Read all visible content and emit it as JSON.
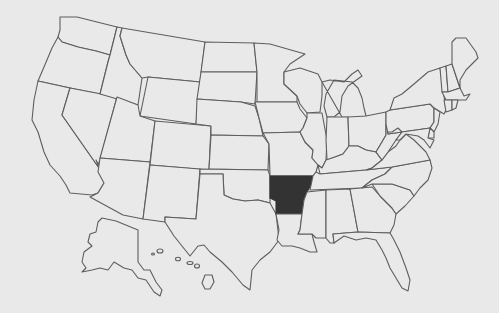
{
  "map": {
    "title": "United States map with one state highlighted",
    "region": "United States",
    "highlighted_state": "Arkansas",
    "colors": {
      "background": "#e9e9e9",
      "state_fill": "#e9e9e9",
      "state_stroke": "#5e5e5e",
      "highlight_fill": "#333333"
    },
    "states": [
      {
        "id": "WA",
        "name": "Washington",
        "points": "60,17 77,17 117,27 110,55 96,51 78,47 62,42 58,37 60,30"
      },
      {
        "id": "OR",
        "name": "Oregon",
        "points": "58,37 62,42 78,47 96,51 110,55 108,62 100,94 70,88 38,81 44,67 52,48"
      },
      {
        "id": "CA",
        "name": "California",
        "points": "38,81 70,88 62,115 106,178 104,183 98,193 92,195 70,193 66,185 60,176 50,165 44,152 38,132 32,120 34,100"
      },
      {
        "id": "NV",
        "name": "Nevada",
        "points": "70,88 117,97 100,160 98,165 96,160 106,178 62,115"
      },
      {
        "id": "ID",
        "name": "Idaho",
        "points": "117,27 122,28 120,36 126,55 130,64 142,78 138,105 100,94 108,62 110,55"
      },
      {
        "id": "MT",
        "name": "Montana",
        "points": "122,28 205,42 200,82 148,77 142,78 130,64 126,55 120,36"
      },
      {
        "id": "WY",
        "name": "Wyoming",
        "points": "148,77 200,82 196,124 140,116"
      },
      {
        "id": "UT",
        "name": "Utah",
        "points": "117,97 138,105 140,116 155,121 150,162 100,158"
      },
      {
        "id": "CO",
        "name": "Colorado",
        "points": "155,121 211,126 209,170 150,165"
      },
      {
        "id": "AZ",
        "name": "Arizona",
        "points": "100,158 150,162 143,219 123,215 90,197 98,193 104,183 98,172"
      },
      {
        "id": "NM",
        "name": "New Mexico",
        "points": "150,165 200,169 196,219 165,217 165,222 143,219"
      },
      {
        "id": "ND",
        "name": "North Dakota",
        "points": "205,42 254,43 257,72 201,72"
      },
      {
        "id": "SD",
        "name": "South Dakota",
        "points": "201,72 257,72 255,104 248,103 241,102 197,99"
      },
      {
        "id": "NE",
        "name": "Nebraska",
        "points": "197,99 241,102 255,106 259,118 263,136 211,135 211,126 196,124"
      },
      {
        "id": "KS",
        "name": "Kansas",
        "points": "211,135 263,136 269,144 268,170 209,169"
      },
      {
        "id": "OK",
        "name": "Oklahoma",
        "points": "200,169 268,170 270,176 270,203 258,200 245,201 233,199 224,195 223,174 200,174"
      },
      {
        "id": "TX",
        "name": "Texas",
        "points": "200,174 223,174 224,195 233,199 245,201 258,200 270,203 276,214 277,222 279,240 270,252 260,260 252,270 250,290 243,285 232,272 222,262 210,252 204,245 198,246 190,256 182,246 174,236 165,222 165,217 196,219"
      },
      {
        "id": "MN",
        "name": "Minnesota",
        "points": "254,43 270,44 284,48 305,54 290,64 284,72 284,84 297,96 297,102 257,102 257,72"
      },
      {
        "id": "IA",
        "name": "Iowa",
        "points": "255,102 297,102 300,109 307,118 303,128 300,132 263,133 259,118"
      },
      {
        "id": "MO",
        "name": "Missouri",
        "points": "263,133 300,132 305,142 313,150 312,158 318,165 316,172 313,176 270,176 269,144"
      },
      {
        "id": "AR",
        "name": "Arkansas",
        "highlight": true,
        "points": "270,176 313,176 311,185 307,192 304,200 302,214 276,214 276,201 270,198"
      },
      {
        "id": "LA",
        "name": "Louisiana",
        "points": "276,214 302,214 300,230 298,234 312,234 314,242 317,252 310,252 300,248 292,246 282,246 277,240 279,230"
      },
      {
        "id": "WI",
        "name": "Wisconsin",
        "points": "284,72 300,68 318,74 322,82 322,96 320,112 307,113 300,104 297,96 284,84"
      },
      {
        "id": "IL",
        "name": "Illinois",
        "points": "307,113 322,113 327,140 326,160 322,168 318,165 312,158 313,150 305,142 300,132 303,128 307,118"
      },
      {
        "id": "MI",
        "name": "Michigan",
        "points": "322,82 330,80 344,82 352,74 358,70 362,76 348,86 342,96 340,112 334,117 327,117 324,106 326,94 334,80 352,82 358,88 362,98 364,108 366,116 360,118 342,117"
      },
      {
        "id": "IN",
        "name": "Indiana",
        "points": "327,117 348,117 349,146 343,154 335,157 327,160 326,140"
      },
      {
        "id": "OH",
        "name": "Ohio",
        "points": "348,117 366,116 386,112 386,135 382,142 376,152 366,150 358,146 349,146"
      },
      {
        "id": "KY",
        "name": "Kentucky",
        "points": "318,165 322,168 326,160 335,157 343,154 349,146 358,146 366,150 376,152 382,160 372,168 366,170 320,174"
      },
      {
        "id": "TN",
        "name": "Tennessee",
        "points": "313,176 316,172 320,174 366,170 392,167 385,174 372,180 362,188 310,190"
      },
      {
        "id": "MS",
        "name": "Mississippi",
        "points": "307,192 326,190 326,238 316,238 312,234 298,234 300,230 302,214 304,200"
      },
      {
        "id": "AL",
        "name": "Alabama",
        "points": "326,190 350,189 358,232 333,234 334,243 330,243 326,238"
      },
      {
        "id": "GA",
        "name": "Georgia",
        "points": "350,189 372,187 380,196 392,208 396,214 394,225 390,233 358,232"
      },
      {
        "id": "FL",
        "name": "Florida",
        "points": "333,234 358,232 390,233 393,238 400,252 406,268 410,280 408,291 402,288 396,278 390,268 386,258 382,250 376,240 366,238 356,240 344,236 334,243"
      },
      {
        "id": "SC",
        "name": "South Carolina",
        "points": "372,184 392,184 410,190 414,196 405,206 396,214 392,208 380,196"
      },
      {
        "id": "NC",
        "name": "North Carolina",
        "points": "362,188 372,180 385,174 392,167 430,160 432,168 428,180 420,188 414,196 410,190 392,184 372,184"
      },
      {
        "id": "VA",
        "name": "Virginia",
        "points": "376,152 382,160 388,152 396,146 400,140 406,134 414,140 420,146 426,152 430,160 392,167 366,170 372,168 382,160"
      },
      {
        "id": "WV",
        "name": "West Virginia",
        "points": "376,152 382,142 386,135 386,124 388,132 392,132 398,128 402,132 396,140 392,146 388,152 382,160"
      },
      {
        "id": "PA",
        "name": "Pennsylvania",
        "points": "386,112 390,110 430,104 434,108 434,122 430,128 388,134 386,124"
      },
      {
        "id": "NY",
        "name": "New York",
        "points": "390,110 394,98 402,94 414,84 428,72 440,68 442,80 444,96 446,110 444,114 434,108 430,104"
      },
      {
        "id": "NJ",
        "name": "New Jersey",
        "points": "434,108 440,112 438,124 434,132 430,128 434,122"
      },
      {
        "id": "DE",
        "name": "Delaware",
        "points": "430,128 434,132 434,138 428,138"
      },
      {
        "id": "MD",
        "name": "Maryland",
        "points": "388,134 430,128 428,138 434,140 430,148 424,140 418,136 406,134 400,140 396,140 402,132 398,128 392,132 388,132"
      },
      {
        "id": "VT",
        "name": "Vermont",
        "points": "440,68 446,66 448,92 442,92"
      },
      {
        "id": "NH",
        "name": "New Hampshire",
        "points": "446,66 452,64 460,88 448,92"
      },
      {
        "id": "ME",
        "name": "Maine",
        "points": "452,64 452,42 456,38 466,38 476,52 478,58 466,70 460,80 460,88"
      },
      {
        "id": "MA",
        "name": "Massachusetts",
        "points": "442,92 448,92 460,88 464,96 470,94 466,100 446,100"
      },
      {
        "id": "CT",
        "name": "Connecticut",
        "points": "444,100 452,100 452,110 446,112"
      },
      {
        "id": "RI",
        "name": "Rhode Island",
        "points": "452,100 458,100 456,108 452,110"
      },
      {
        "id": "AK",
        "name": "Alaska",
        "points": "116,221 102,218 98,222 96,232 90,234 88,242 92,246 84,252 82,262 86,268 82,272 92,270 100,268 108,270 114,262 124,268 132,270 138,278 146,280 154,292 160,296 162,290 156,282 150,270 144,270 138,262 138,230"
      },
      {
        "id": "HI",
        "name": "Hawaii",
        "points": "205,275 212,275 214,282 210,289 205,289 202,283"
      }
    ],
    "hawaii_small_islands": [
      {
        "cx": 160,
        "cy": 251,
        "rx": 3,
        "ry": 2
      },
      {
        "cx": 153,
        "cy": 254,
        "rx": 1.5,
        "ry": 1
      },
      {
        "cx": 178,
        "cy": 259,
        "rx": 2.5,
        "ry": 1.8
      },
      {
        "cx": 190,
        "cy": 263,
        "rx": 3,
        "ry": 1.5
      },
      {
        "cx": 197,
        "cy": 266,
        "rx": 2.5,
        "ry": 2
      }
    ]
  }
}
